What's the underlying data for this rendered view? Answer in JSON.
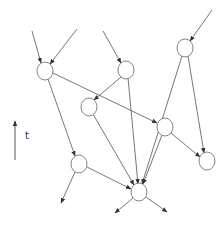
{
  "diagram": {
    "type": "directed-acyclic-graph",
    "time_axis": {
      "label": "t",
      "direction": "up"
    },
    "stroke_color": "#555555",
    "node_fill": "#ffffff",
    "nodes": [
      {
        "id": "n1",
        "x": 45,
        "y": 71
      },
      {
        "id": "n2",
        "x": 126,
        "y": 70
      },
      {
        "id": "n3",
        "x": 185,
        "y": 48
      },
      {
        "id": "n4",
        "x": 89,
        "y": 107
      },
      {
        "id": "n5",
        "x": 165,
        "y": 127
      },
      {
        "id": "n6",
        "x": 79,
        "y": 164
      },
      {
        "id": "n7",
        "x": 139,
        "y": 192
      },
      {
        "id": "n8",
        "x": 207,
        "y": 161
      }
    ],
    "edges": [
      {
        "from": "in1",
        "to": "n1"
      },
      {
        "from": "in2",
        "to": "n1"
      },
      {
        "from": "in3",
        "to": "n2"
      },
      {
        "from": "in4",
        "to": "n3"
      },
      {
        "from": "n1",
        "to": "n5"
      },
      {
        "from": "n1",
        "to": "n6"
      },
      {
        "from": "n2",
        "to": "n4"
      },
      {
        "from": "n2",
        "to": "n7"
      },
      {
        "from": "n3",
        "to": "n7"
      },
      {
        "from": "n3",
        "to": "n8"
      },
      {
        "from": "n4",
        "to": "n7"
      },
      {
        "from": "n5",
        "to": "n7"
      },
      {
        "from": "n5",
        "to": "n8"
      },
      {
        "from": "n6",
        "to": "n7"
      },
      {
        "from": "n6",
        "to": "out1"
      },
      {
        "from": "n7",
        "to": "out2"
      },
      {
        "from": "n7",
        "to": "out3"
      }
    ]
  }
}
